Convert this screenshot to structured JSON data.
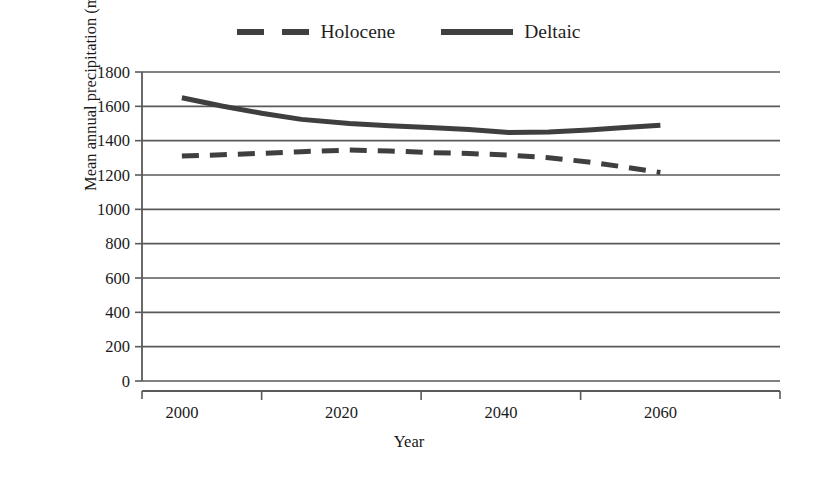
{
  "chart_data": {
    "type": "line",
    "title": "",
    "xlabel": "Year",
    "ylabel": "Mean annual precipitation (mm)",
    "xlim": [
      1995,
      2075
    ],
    "ylim": [
      0,
      1800
    ],
    "ytick_step": 200,
    "grid": true,
    "legend_position": "top-center",
    "yticks": [
      0,
      200,
      400,
      600,
      800,
      1000,
      1200,
      1400,
      1600,
      1800
    ],
    "ytick_labels": [
      "0",
      "200",
      "400",
      "600",
      "800",
      "1000",
      "1200",
      "1400",
      "1600",
      "1800"
    ],
    "xticks": [
      2000,
      2020,
      2040,
      2060
    ],
    "xtick_labels": [
      "2000",
      "2020",
      "2040",
      "2060"
    ],
    "series": [
      {
        "name": "Holocene",
        "style": "dashed",
        "color": "#3f3f3f",
        "x": [
          2000,
          2005,
          2010,
          2015,
          2021,
          2026,
          2031,
          2036,
          2041,
          2046,
          2051,
          2056,
          2060
        ],
        "values": [
          1310,
          1318,
          1326,
          1336,
          1345,
          1340,
          1331,
          1325,
          1316,
          1300,
          1276,
          1243,
          1215
        ]
      },
      {
        "name": "Deltaic",
        "style": "solid",
        "color": "#3f3f3f",
        "x": [
          2000,
          2005,
          2010,
          2015,
          2021,
          2026,
          2031,
          2036,
          2041,
          2046,
          2051,
          2056,
          2060
        ],
        "values": [
          1650,
          1602,
          1560,
          1524,
          1500,
          1487,
          1477,
          1465,
          1448,
          1450,
          1462,
          1478,
          1490
        ]
      }
    ]
  },
  "legend": {
    "entries": [
      {
        "label": "Holocene",
        "style": "dashed"
      },
      {
        "label": "Deltaic",
        "style": "solid"
      }
    ]
  },
  "axes": {
    "x_title": "Year",
    "y_title": "Mean annual precipitation (mm)"
  }
}
